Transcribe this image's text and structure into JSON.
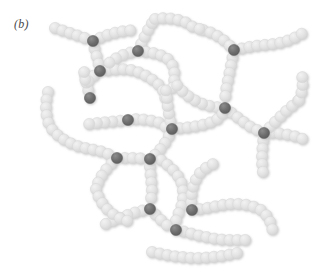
{
  "figure": {
    "panel_label": "(b)",
    "caption_type": "crosslinked-polymer-network-schematic",
    "width": 319,
    "height": 274,
    "background_color": "#ffffff"
  },
  "legend_semantics": {
    "chain_bead_meaning": "polymer chain repeat unit",
    "crosslink_bead_meaning": "crosslink junction point"
  },
  "style": {
    "bead_radius": 5.6,
    "bead_spacing": 7.8,
    "chain_bead_color": "#e2e2e2",
    "chain_bead_edge_color": "#d6d6d6",
    "crosslink_bead_color": "#6e6e6e",
    "crosslink_bead_edge_color": "#5a5a5a",
    "highlight_color": "#f2f2f2",
    "shadow_color": "#cfcfcf"
  },
  "chart_data": {
    "type": "diagram",
    "title": "(b)",
    "counts": {
      "crosslink_points": 14,
      "chain_segments": 22
    },
    "crosslinks": [
      {
        "id": "X1",
        "x": 93,
        "y": 41
      },
      {
        "id": "X2",
        "x": 138,
        "y": 51
      },
      {
        "id": "X3",
        "x": 100,
        "y": 71
      },
      {
        "id": "X4",
        "x": 234,
        "y": 50
      },
      {
        "id": "X5",
        "x": 225,
        "y": 108
      },
      {
        "id": "X6",
        "x": 128,
        "y": 120
      },
      {
        "id": "X7",
        "x": 172,
        "y": 129
      },
      {
        "id": "X8",
        "x": 264,
        "y": 133
      },
      {
        "id": "X9",
        "x": 117,
        "y": 158
      },
      {
        "id": "X10",
        "x": 150,
        "y": 159
      },
      {
        "id": "X11",
        "x": 150,
        "y": 209
      },
      {
        "id": "X12",
        "x": 192,
        "y": 210
      },
      {
        "id": "X13",
        "x": 176,
        "y": 230
      },
      {
        "id": "X14",
        "x": 90,
        "y": 98
      }
    ],
    "chains": [
      {
        "name": "chain-tl-west-arm",
        "points": [
          [
            55,
            28
          ],
          [
            64,
            31
          ],
          [
            73,
            34
          ],
          [
            82,
            37
          ],
          [
            93,
            41
          ]
        ]
      },
      {
        "name": "chain-tl-east-arm",
        "points": [
          [
            93,
            41
          ],
          [
            104,
            36
          ],
          [
            114,
            33
          ],
          [
            124,
            31
          ],
          [
            134,
            30
          ]
        ]
      },
      {
        "name": "chain-tl-down-arm",
        "points": [
          [
            93,
            41
          ],
          [
            95,
            51
          ],
          [
            98,
            61
          ],
          [
            100,
            71
          ]
        ]
      },
      {
        "name": "chain-x3-east",
        "points": [
          [
            100,
            71
          ],
          [
            111,
            70
          ],
          [
            121,
            69
          ],
          [
            131,
            70
          ],
          [
            141,
            73
          ],
          [
            150,
            78
          ],
          [
            158,
            84
          ],
          [
            164,
            92
          ],
          [
            166,
            101
          ]
        ]
      },
      {
        "name": "chain-x2-up",
        "points": [
          [
            138,
            51
          ],
          [
            142,
            42
          ],
          [
            146,
            34
          ],
          [
            150,
            26
          ],
          [
            155,
            19
          ]
        ]
      },
      {
        "name": "chain-x2-east",
        "points": [
          [
            138,
            51
          ],
          [
            148,
            52
          ],
          [
            158,
            54
          ],
          [
            167,
            58
          ],
          [
            173,
            66
          ],
          [
            175,
            76
          ],
          [
            173,
            86
          ],
          [
            170,
            95
          ]
        ]
      },
      {
        "name": "chain-x2-west",
        "points": [
          [
            138,
            51
          ],
          [
            128,
            53
          ],
          [
            118,
            57
          ],
          [
            109,
            63
          ],
          [
            100,
            71
          ]
        ]
      },
      {
        "name": "chain-tr-west-arm",
        "points": [
          [
            203,
            30
          ],
          [
            212,
            33
          ],
          [
            221,
            38
          ],
          [
            228,
            44
          ],
          [
            234,
            50
          ]
        ]
      },
      {
        "name": "chain-tr-east-arm",
        "points": [
          [
            234,
            50
          ],
          [
            244,
            48
          ],
          [
            254,
            46
          ],
          [
            264,
            45
          ],
          [
            274,
            44
          ],
          [
            284,
            42
          ],
          [
            294,
            38
          ],
          [
            303,
            33
          ]
        ]
      },
      {
        "name": "chain-tr-down-arm",
        "points": [
          [
            234,
            50
          ],
          [
            232,
            60
          ],
          [
            230,
            70
          ],
          [
            228,
            80
          ],
          [
            226,
            90
          ],
          [
            225,
            99
          ],
          [
            225,
            108
          ]
        ]
      },
      {
        "name": "chain-x5-west",
        "points": [
          [
            225,
            108
          ],
          [
            215,
            107
          ],
          [
            205,
            105
          ],
          [
            196,
            101
          ],
          [
            188,
            96
          ],
          [
            181,
            90
          ],
          [
            175,
            83
          ]
        ]
      },
      {
        "name": "chain-x5-southeast",
        "points": [
          [
            225,
            108
          ],
          [
            233,
            114
          ],
          [
            241,
            120
          ],
          [
            249,
            126
          ],
          [
            257,
            130
          ],
          [
            264,
            133
          ]
        ]
      },
      {
        "name": "chain-x8-east",
        "points": [
          [
            264,
            133
          ],
          [
            274,
            133
          ],
          [
            284,
            134
          ],
          [
            294,
            136
          ],
          [
            303,
            139
          ]
        ]
      },
      {
        "name": "chain-x8-northeast",
        "points": [
          [
            264,
            133
          ],
          [
            271,
            126
          ],
          [
            278,
            119
          ],
          [
            285,
            112
          ],
          [
            292,
            106
          ],
          [
            299,
            100
          ]
        ]
      },
      {
        "name": "chain-x8-south",
        "points": [
          [
            264,
            133
          ],
          [
            263,
            143
          ],
          [
            262,
            153
          ],
          [
            262,
            163
          ],
          [
            263,
            173
          ]
        ]
      },
      {
        "name": "chain-left-loop",
        "points": [
          [
            48,
            92
          ],
          [
            46,
            102
          ],
          [
            46,
            112
          ],
          [
            48,
            122
          ],
          [
            53,
            131
          ],
          [
            61,
            138
          ],
          [
            70,
            143
          ],
          [
            80,
            147
          ],
          [
            90,
            149
          ],
          [
            100,
            151
          ],
          [
            108,
            154
          ],
          [
            117,
            158
          ]
        ]
      },
      {
        "name": "chain-x14-up",
        "points": [
          [
            90,
            98
          ],
          [
            88,
            89
          ],
          [
            86,
            80
          ],
          [
            84,
            71
          ]
        ]
      },
      {
        "name": "chain-x6-west",
        "points": [
          [
            128,
            120
          ],
          [
            118,
            121
          ],
          [
            108,
            122
          ],
          [
            98,
            123
          ],
          [
            89,
            124
          ]
        ]
      },
      {
        "name": "chain-x6-east",
        "points": [
          [
            128,
            120
          ],
          [
            138,
            119
          ],
          [
            148,
            120
          ],
          [
            158,
            122
          ],
          [
            166,
            127
          ],
          [
            172,
            129
          ]
        ]
      },
      {
        "name": "chain-x7-northwest",
        "points": [
          [
            172,
            129
          ],
          [
            170,
            119
          ],
          [
            168,
            109
          ],
          [
            167,
            99
          ],
          [
            166,
            90
          ]
        ]
      },
      {
        "name": "chain-x7-east",
        "points": [
          [
            172,
            129
          ],
          [
            182,
            128
          ],
          [
            192,
            127
          ],
          [
            202,
            125
          ],
          [
            212,
            122
          ],
          [
            221,
            117
          ],
          [
            225,
            108
          ]
        ]
      },
      {
        "name": "chain-x7-south",
        "points": [
          [
            172,
            129
          ],
          [
            168,
            138
          ],
          [
            163,
            146
          ],
          [
            157,
            153
          ],
          [
            150,
            159
          ]
        ]
      },
      {
        "name": "chain-x9-east",
        "points": [
          [
            117,
            158
          ],
          [
            127,
            158
          ],
          [
            137,
            158
          ],
          [
            146,
            159
          ],
          [
            150,
            159
          ]
        ]
      },
      {
        "name": "chain-x9-southwest",
        "points": [
          [
            117,
            158
          ],
          [
            110,
            165
          ],
          [
            104,
            172
          ],
          [
            99,
            180
          ],
          [
            96,
            189
          ]
        ]
      },
      {
        "name": "chain-x10-south",
        "points": [
          [
            150,
            159
          ],
          [
            150,
            169
          ],
          [
            151,
            179
          ],
          [
            152,
            189
          ],
          [
            151,
            199
          ],
          [
            150,
            209
          ]
        ]
      },
      {
        "name": "chain-mid-loop",
        "points": [
          [
            161,
            160
          ],
          [
            169,
            166
          ],
          [
            176,
            173
          ],
          [
            181,
            181
          ],
          [
            183,
            191
          ],
          [
            183,
            201
          ],
          [
            180,
            210
          ],
          [
            176,
            219
          ],
          [
            176,
            230
          ]
        ]
      },
      {
        "name": "chain-x11-west",
        "points": [
          [
            150,
            209
          ],
          [
            140,
            211
          ],
          [
            130,
            214
          ],
          [
            120,
            218
          ],
          [
            110,
            222
          ],
          [
            101,
            226
          ]
        ]
      },
      {
        "name": "chain-x11-southeast",
        "points": [
          [
            150,
            209
          ],
          [
            157,
            216
          ],
          [
            164,
            223
          ],
          [
            171,
            228
          ],
          [
            176,
            230
          ]
        ]
      },
      {
        "name": "chain-x13-east",
        "points": [
          [
            176,
            230
          ],
          [
            186,
            232
          ],
          [
            196,
            235
          ],
          [
            206,
            237
          ],
          [
            216,
            239
          ],
          [
            226,
            240
          ],
          [
            236,
            240
          ],
          [
            246,
            240
          ]
        ]
      },
      {
        "name": "chain-x12-east",
        "points": [
          [
            192,
            210
          ],
          [
            202,
            209
          ],
          [
            212,
            207
          ],
          [
            222,
            205
          ],
          [
            232,
            204
          ],
          [
            242,
            204
          ],
          [
            252,
            206
          ],
          [
            261,
            210
          ],
          [
            268,
            217
          ],
          [
            272,
            226
          ],
          [
            273,
            236
          ]
        ]
      },
      {
        "name": "chain-x12-northwest",
        "points": [
          [
            192,
            210
          ],
          [
            191,
            200
          ],
          [
            192,
            190
          ],
          [
            195,
            181
          ],
          [
            200,
            173
          ],
          [
            207,
            167
          ],
          [
            215,
            163
          ]
        ]
      },
      {
        "name": "chain-bottom-right",
        "points": [
          [
            152,
            252
          ],
          [
            162,
            254
          ],
          [
            172,
            256
          ],
          [
            182,
            257
          ],
          [
            192,
            258
          ],
          [
            202,
            258
          ],
          [
            212,
            257
          ],
          [
            222,
            256
          ],
          [
            232,
            254
          ],
          [
            242,
            252
          ]
        ]
      },
      {
        "name": "chain-lower-left-tail",
        "points": [
          [
            96,
            189
          ],
          [
            99,
            198
          ],
          [
            104,
            206
          ],
          [
            111,
            213
          ],
          [
            119,
            218
          ],
          [
            128,
            221
          ]
        ]
      },
      {
        "name": "chain-x3-upleft",
        "points": [
          [
            100,
            71
          ],
          [
            92,
            77
          ],
          [
            86,
            84
          ],
          [
            84,
            71
          ]
        ]
      },
      {
        "name": "chain-upper-mid-arc",
        "points": [
          [
            155,
            19
          ],
          [
            165,
            18
          ],
          [
            175,
            19
          ],
          [
            185,
            22
          ],
          [
            193,
            27
          ],
          [
            203,
            30
          ]
        ]
      },
      {
        "name": "chain-right-upper",
        "points": [
          [
            299,
            100
          ],
          [
            302,
            91
          ],
          [
            303,
            81
          ],
          [
            301,
            71
          ]
        ]
      }
    ]
  }
}
